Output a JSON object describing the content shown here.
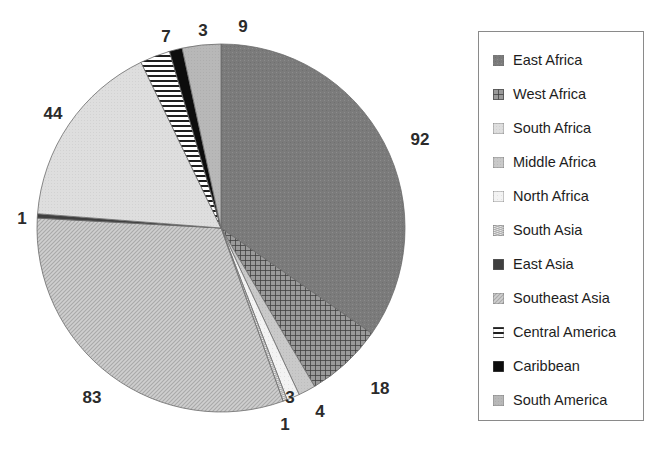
{
  "title_ghost": "",
  "chart_data": {
    "type": "pie",
    "title": "",
    "total": 265,
    "units": "count",
    "start_angle_deg": 0,
    "direction": "clockwise",
    "legend_position": "right",
    "grid": false,
    "categories": [
      "East Africa",
      "West Africa",
      "Middle Africa",
      "North Africa",
      "South Asia",
      "Southeast Asia",
      "East Asia",
      "South Africa",
      "Central America",
      "Caribbean",
      "South America"
    ],
    "values": [
      92,
      18,
      4,
      3,
      1,
      83,
      1,
      44,
      7,
      3,
      9
    ],
    "slices": [
      {
        "label": "East Africa",
        "value": 92,
        "fill": "#777777",
        "pattern": "solid-dark-gray",
        "start_deg": 0.0,
        "end_deg": 124.98
      },
      {
        "label": "West Africa",
        "value": 18,
        "fill": "#555555",
        "pattern": "crosshatch-dark",
        "start_deg": 124.98,
        "end_deg": 149.43
      },
      {
        "label": "Middle Africa",
        "value": 4,
        "fill": "#c9c9c9",
        "pattern": "solid-light-gray",
        "start_deg": 149.43,
        "end_deg": 154.87
      },
      {
        "label": "North Africa",
        "value": 3,
        "fill": "#efefef",
        "pattern": "very-light",
        "start_deg": 154.87,
        "end_deg": 158.94
      },
      {
        "label": "South Asia",
        "value": 1,
        "fill": "#a8a8a8",
        "pattern": "wave-light",
        "start_deg": 158.94,
        "end_deg": 160.3
      },
      {
        "label": "Southeast Asia",
        "value": 83,
        "fill": "#bdbdbd",
        "pattern": "fine-diagonal",
        "start_deg": 160.3,
        "end_deg": 273.09
      },
      {
        "label": "East Asia",
        "value": 1,
        "fill": "#4a4a4a",
        "pattern": "solid-near-black",
        "start_deg": 273.09,
        "end_deg": 274.45
      },
      {
        "label": "South Africa",
        "value": 44,
        "fill": "#dcdcdc",
        "pattern": "pale-gray",
        "start_deg": 274.45,
        "end_deg": 334.23
      },
      {
        "label": "Central America",
        "value": 7,
        "fill": "#ffffff",
        "pattern": "horizontal-lines",
        "start_deg": 334.23,
        "end_deg": 343.74
      },
      {
        "label": "Caribbean",
        "value": 3,
        "fill": "#111111",
        "pattern": "solid-black",
        "start_deg": 343.74,
        "end_deg": 347.81
      },
      {
        "label": "South America",
        "value": 9,
        "fill": "#b5b5b5",
        "pattern": "mid-gray",
        "start_deg": 347.81,
        "end_deg": 360.0
      }
    ],
    "data_labels": [
      {
        "text": "92",
        "x": 420,
        "y": 140
      },
      {
        "text": "18",
        "x": 380,
        "y": 389
      },
      {
        "text": "4",
        "x": 320,
        "y": 412
      },
      {
        "text": "3",
        "x": 290,
        "y": 398
      },
      {
        "text": "1",
        "x": 285,
        "y": 425
      },
      {
        "text": "83",
        "x": 92,
        "y": 398
      },
      {
        "text": "1",
        "x": 22,
        "y": 219
      },
      {
        "text": "44",
        "x": 53,
        "y": 114
      },
      {
        "text": "7",
        "x": 166,
        "y": 37
      },
      {
        "text": "3",
        "x": 203,
        "y": 31
      },
      {
        "text": "9",
        "x": 243,
        "y": 27
      }
    ]
  },
  "legend": {
    "items": [
      {
        "label": "East Africa",
        "swatch": "solid-dark-gray"
      },
      {
        "label": "West Africa",
        "swatch": "crosshatch-dark"
      },
      {
        "label": "South Africa",
        "swatch": "pale-gray"
      },
      {
        "label": "Middle Africa",
        "swatch": "solid-light-gray"
      },
      {
        "label": "North Africa",
        "swatch": "very-light"
      },
      {
        "label": "South Asia",
        "swatch": "wave-light"
      },
      {
        "label": "East Asia",
        "swatch": "solid-near-black"
      },
      {
        "label": "Southeast Asia",
        "swatch": "fine-diagonal"
      },
      {
        "label": "Central America",
        "swatch": "horizontal-lines"
      },
      {
        "label": "Caribbean",
        "swatch": "solid-black"
      },
      {
        "label": "South America",
        "swatch": "mid-gray"
      }
    ]
  },
  "colors": {
    "background": "#ffffff",
    "label_text": "#2b2b2b",
    "legend_border": "#8a8a8a",
    "legend_text": "#1d1d1d"
  },
  "geometry": {
    "center_x": 221,
    "center_y": 228,
    "radius": 184
  }
}
